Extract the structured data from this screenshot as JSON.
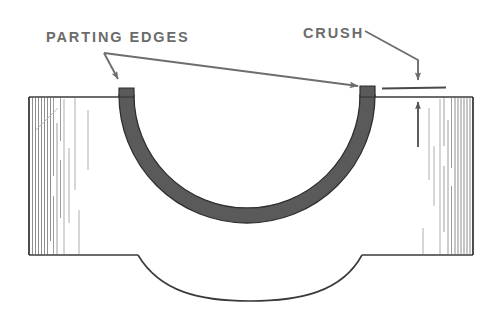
{
  "figure": {
    "background_color": "#ffffff",
    "outline_color": "#3a3a3a",
    "shell_fill_color": "#5a5a5a",
    "leader_color": "#6e6e6e",
    "text_color": "#6b6b6b",
    "hatch_color": "#7a7a7a"
  },
  "labels": {
    "parting_edges": "PARTING EDGES",
    "crush": "CRUSH"
  },
  "annotations": {
    "left_leader": "leader-arrow-to-left-parting-edge",
    "long_leader": "leader-arrow-to-right-parting-edge",
    "crush_leader": "leader-arrow-down-to-crush-line",
    "crush_dimension_up": "crush-dimension-arrow-up",
    "crush_reference_line": "crush-reference-line"
  },
  "parts": {
    "left_block": "bearing-housing-left-block",
    "right_block": "bearing-housing-right-block",
    "shell": "bearing-shell-semicircle",
    "left_parting_edge": "left-parting-edge-tab",
    "right_parting_edge": "right-parting-edge-tab",
    "lower_bore_arc": "lower-bore-arc"
  }
}
